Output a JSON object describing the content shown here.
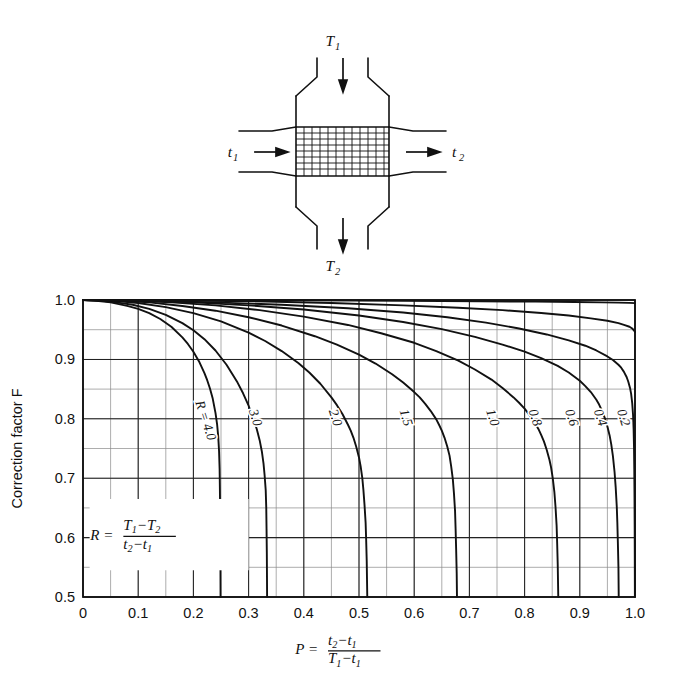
{
  "figure": {
    "diagram": {
      "name": "crossflow-heat-exchanger-schematic",
      "labels": {
        "hot_in": "T1",
        "hot_in_sub": "1",
        "hot_in_main": "T",
        "hot_out_main": "T",
        "hot_out_sub": "2",
        "cold_in_main": "t",
        "cold_in_sub": "1",
        "cold_out_main": "t",
        "cold_out_sub": "2"
      }
    }
  },
  "chart_data": {
    "type": "line",
    "title": "",
    "xlabel_parts": {
      "variable": "P",
      "equals": "=",
      "numerator_a": "t",
      "numerator_a_sub": "2",
      "numerator_minus": "−",
      "numerator_b": "t",
      "numerator_b_sub": "1",
      "denominator_a": "T",
      "denominator_a_sub": "1",
      "denominator_minus": "−",
      "denominator_b": "t",
      "denominator_b_sub": "1"
    },
    "ylabel": "Correction factor F",
    "ylabel_main": "Correction factor",
    "ylabel_italic": "F",
    "annotation_R": {
      "variable": "R",
      "equals": "=",
      "numerator_a": "T",
      "numerator_a_sub": "1",
      "numerator_minus": "−",
      "numerator_b": "T",
      "numerator_b_sub": "2",
      "denominator_a": "t",
      "denominator_a_sub": "2",
      "denominator_minus": "−",
      "denominator_b": "t",
      "denominator_b_sub": "1"
    },
    "xlim": [
      0,
      1.0
    ],
    "ylim": [
      0.5,
      1.0
    ],
    "xticks": [
      0,
      0.1,
      0.2,
      0.3,
      0.4,
      0.5,
      0.6,
      0.7,
      0.8,
      0.9,
      1.0
    ],
    "xticklabels": [
      "0",
      "0.1",
      "0.2",
      "0.3",
      "0.4",
      "0.5",
      "0.6",
      "0.7",
      "0.8",
      "0.9",
      "1.0"
    ],
    "yticks": [
      0.5,
      0.6,
      0.7,
      0.8,
      0.9,
      1.0
    ],
    "yticklabels": [
      "0.5",
      "0.6",
      "0.7",
      "0.8",
      "0.9",
      "1.0"
    ],
    "x_minor_step": 0.05,
    "y_minor_step": 0.05,
    "grid": true,
    "legend": "inline-curve-labels",
    "series": [
      {
        "name": "R = 4.0",
        "label": "R = 4.0",
        "label_prefix": "R =",
        "value": "4.0",
        "points": [
          [
            0,
            1.0
          ],
          [
            0.02,
            0.999
          ],
          [
            0.05,
            0.996
          ],
          [
            0.08,
            0.99
          ],
          [
            0.1,
            0.985
          ],
          [
            0.12,
            0.978
          ],
          [
            0.14,
            0.968
          ],
          [
            0.16,
            0.955
          ],
          [
            0.18,
            0.937
          ],
          [
            0.19,
            0.926
          ],
          [
            0.2,
            0.913
          ],
          [
            0.21,
            0.897
          ],
          [
            0.22,
            0.877
          ],
          [
            0.225,
            0.865
          ],
          [
            0.23,
            0.851
          ],
          [
            0.235,
            0.834
          ],
          [
            0.24,
            0.81
          ],
          [
            0.243,
            0.79
          ],
          [
            0.245,
            0.77
          ],
          [
            0.2465,
            0.745
          ],
          [
            0.2475,
            0.715
          ],
          [
            0.248,
            0.68
          ],
          [
            0.2485,
            0.64
          ],
          [
            0.2488,
            0.6
          ],
          [
            0.249,
            0.555
          ],
          [
            0.2492,
            0.5
          ]
        ]
      },
      {
        "name": "R = 3.0",
        "label": "3.0",
        "value": "3.0",
        "points": [
          [
            0,
            1.0
          ],
          [
            0.03,
            0.999
          ],
          [
            0.06,
            0.996
          ],
          [
            0.09,
            0.992
          ],
          [
            0.12,
            0.985
          ],
          [
            0.15,
            0.975
          ],
          [
            0.18,
            0.961
          ],
          [
            0.2,
            0.949
          ],
          [
            0.22,
            0.934
          ],
          [
            0.24,
            0.915
          ],
          [
            0.26,
            0.891
          ],
          [
            0.28,
            0.861
          ],
          [
            0.29,
            0.843
          ],
          [
            0.3,
            0.822
          ],
          [
            0.31,
            0.797
          ],
          [
            0.315,
            0.782
          ],
          [
            0.32,
            0.764
          ],
          [
            0.324,
            0.745
          ],
          [
            0.327,
            0.725
          ],
          [
            0.329,
            0.705
          ],
          [
            0.331,
            0.68
          ],
          [
            0.332,
            0.65
          ],
          [
            0.3325,
            0.615
          ],
          [
            0.333,
            0.575
          ],
          [
            0.3333,
            0.535
          ],
          [
            0.3335,
            0.5
          ]
        ]
      },
      {
        "name": "R = 2.0",
        "label": "2.0",
        "value": "2.0",
        "points": [
          [
            0,
            1.0
          ],
          [
            0.05,
            0.999
          ],
          [
            0.1,
            0.995
          ],
          [
            0.15,
            0.988
          ],
          [
            0.2,
            0.978
          ],
          [
            0.25,
            0.964
          ],
          [
            0.3,
            0.945
          ],
          [
            0.33,
            0.931
          ],
          [
            0.36,
            0.914
          ],
          [
            0.39,
            0.894
          ],
          [
            0.41,
            0.878
          ],
          [
            0.43,
            0.859
          ],
          [
            0.45,
            0.836
          ],
          [
            0.46,
            0.823
          ],
          [
            0.47,
            0.808
          ],
          [
            0.48,
            0.79
          ],
          [
            0.485,
            0.78
          ],
          [
            0.49,
            0.768
          ],
          [
            0.495,
            0.753
          ],
          [
            0.5,
            0.735
          ],
          [
            0.503,
            0.72
          ],
          [
            0.506,
            0.7
          ],
          [
            0.508,
            0.68
          ],
          [
            0.51,
            0.655
          ],
          [
            0.512,
            0.625
          ],
          [
            0.513,
            0.595
          ],
          [
            0.514,
            0.56
          ],
          [
            0.5145,
            0.53
          ],
          [
            0.515,
            0.5
          ]
        ]
      },
      {
        "name": "R = 1.5",
        "label": "1.5",
        "value": "1.5",
        "points": [
          [
            0,
            1.0
          ],
          [
            0.06,
            0.999
          ],
          [
            0.12,
            0.996
          ],
          [
            0.18,
            0.99
          ],
          [
            0.24,
            0.982
          ],
          [
            0.3,
            0.971
          ],
          [
            0.36,
            0.957
          ],
          [
            0.42,
            0.939
          ],
          [
            0.46,
            0.925
          ],
          [
            0.5,
            0.908
          ],
          [
            0.53,
            0.893
          ],
          [
            0.56,
            0.875
          ],
          [
            0.58,
            0.861
          ],
          [
            0.6,
            0.845
          ],
          [
            0.61,
            0.836
          ],
          [
            0.62,
            0.825
          ],
          [
            0.63,
            0.813
          ],
          [
            0.64,
            0.799
          ],
          [
            0.645,
            0.79
          ],
          [
            0.65,
            0.78
          ],
          [
            0.655,
            0.768
          ],
          [
            0.66,
            0.753
          ],
          [
            0.664,
            0.738
          ],
          [
            0.667,
            0.72
          ],
          [
            0.67,
            0.698
          ],
          [
            0.672,
            0.675
          ],
          [
            0.674,
            0.645
          ],
          [
            0.675,
            0.615
          ],
          [
            0.676,
            0.58
          ],
          [
            0.677,
            0.54
          ],
          [
            0.6775,
            0.5
          ]
        ]
      },
      {
        "name": "R = 1.0",
        "label": "1.0",
        "value": "1.0",
        "points": [
          [
            0,
            1.0
          ],
          [
            0.08,
            0.999
          ],
          [
            0.16,
            0.996
          ],
          [
            0.24,
            0.991
          ],
          [
            0.32,
            0.983
          ],
          [
            0.4,
            0.972
          ],
          [
            0.48,
            0.958
          ],
          [
            0.54,
            0.944
          ],
          [
            0.6,
            0.928
          ],
          [
            0.64,
            0.914
          ],
          [
            0.68,
            0.898
          ],
          [
            0.71,
            0.883
          ],
          [
            0.74,
            0.866
          ],
          [
            0.76,
            0.852
          ],
          [
            0.78,
            0.836
          ],
          [
            0.79,
            0.827
          ],
          [
            0.8,
            0.817
          ],
          [
            0.81,
            0.805
          ],
          [
            0.82,
            0.791
          ],
          [
            0.825,
            0.783
          ],
          [
            0.83,
            0.773
          ],
          [
            0.835,
            0.762
          ],
          [
            0.84,
            0.748
          ],
          [
            0.845,
            0.731
          ],
          [
            0.848,
            0.718
          ],
          [
            0.851,
            0.7
          ],
          [
            0.854,
            0.676
          ],
          [
            0.856,
            0.652
          ],
          [
            0.858,
            0.62
          ],
          [
            0.859,
            0.59
          ],
          [
            0.86,
            0.555
          ],
          [
            0.861,
            0.5
          ]
        ]
      },
      {
        "name": "R = 0.8",
        "label": "0.8",
        "value": "0.8",
        "points": [
          [
            0,
            1.0
          ],
          [
            0.1,
            0.999
          ],
          [
            0.2,
            0.996
          ],
          [
            0.3,
            0.991
          ],
          [
            0.4,
            0.984
          ],
          [
            0.5,
            0.974
          ],
          [
            0.58,
            0.963
          ],
          [
            0.65,
            0.951
          ],
          [
            0.71,
            0.938
          ],
          [
            0.76,
            0.925
          ],
          [
            0.8,
            0.913
          ],
          [
            0.83,
            0.902
          ],
          [
            0.86,
            0.889
          ],
          [
            0.88,
            0.878
          ],
          [
            0.9,
            0.864
          ],
          [
            0.91,
            0.855
          ],
          [
            0.92,
            0.845
          ],
          [
            0.93,
            0.832
          ],
          [
            0.935,
            0.824
          ],
          [
            0.94,
            0.814
          ],
          [
            0.945,
            0.802
          ],
          [
            0.95,
            0.787
          ],
          [
            0.954,
            0.772
          ],
          [
            0.957,
            0.757
          ],
          [
            0.96,
            0.737
          ],
          [
            0.963,
            0.71
          ],
          [
            0.965,
            0.685
          ],
          [
            0.967,
            0.652
          ],
          [
            0.968,
            0.625
          ],
          [
            0.969,
            0.59
          ],
          [
            0.97,
            0.55
          ],
          [
            0.9705,
            0.5
          ]
        ]
      },
      {
        "name": "R = 0.6",
        "label": "0.6",
        "value": "0.6",
        "points": [
          [
            0,
            1.0
          ],
          [
            0.12,
            0.999
          ],
          [
            0.24,
            0.996
          ],
          [
            0.36,
            0.992
          ],
          [
            0.48,
            0.986
          ],
          [
            0.58,
            0.979
          ],
          [
            0.66,
            0.971
          ],
          [
            0.73,
            0.962
          ],
          [
            0.79,
            0.952
          ],
          [
            0.84,
            0.942
          ],
          [
            0.88,
            0.932
          ],
          [
            0.91,
            0.923
          ],
          [
            0.93,
            0.915
          ],
          [
            0.95,
            0.905
          ],
          [
            0.96,
            0.899
          ],
          [
            0.97,
            0.891
          ],
          [
            0.975,
            0.886
          ],
          [
            0.98,
            0.879
          ],
          [
            0.985,
            0.87
          ],
          [
            0.988,
            0.862
          ],
          [
            0.991,
            0.852
          ],
          [
            0.993,
            0.842
          ],
          [
            0.995,
            0.826
          ],
          [
            0.9965,
            0.806
          ],
          [
            0.9975,
            0.782
          ],
          [
            0.9982,
            0.752
          ],
          [
            0.9987,
            0.715
          ],
          [
            0.9991,
            0.67
          ],
          [
            0.9994,
            0.62
          ],
          [
            0.9996,
            0.565
          ],
          [
            0.9998,
            0.5
          ]
        ]
      },
      {
        "name": "R = 0.4",
        "label": "0.4",
        "value": "0.4",
        "points": [
          [
            0,
            1.0
          ],
          [
            0.15,
            0.9995
          ],
          [
            0.3,
            0.998
          ],
          [
            0.45,
            0.995
          ],
          [
            0.58,
            0.991
          ],
          [
            0.68,
            0.987
          ],
          [
            0.76,
            0.983
          ],
          [
            0.83,
            0.978
          ],
          [
            0.88,
            0.974
          ],
          [
            0.92,
            0.969
          ],
          [
            0.95,
            0.965
          ],
          [
            0.97,
            0.961
          ],
          [
            0.98,
            0.958
          ],
          [
            0.99,
            0.955
          ],
          [
            0.995,
            0.952
          ],
          [
            0.998,
            0.949
          ],
          [
            1.0,
            0.946
          ]
        ]
      },
      {
        "name": "R = 0.2",
        "label": "0.2",
        "value": "0.2",
        "points": [
          [
            0,
            1.0
          ],
          [
            0.2,
            0.9998
          ],
          [
            0.4,
            0.9993
          ],
          [
            0.58,
            0.9986
          ],
          [
            0.72,
            0.9979
          ],
          [
            0.82,
            0.9972
          ],
          [
            0.89,
            0.9966
          ],
          [
            0.94,
            0.996
          ],
          [
            0.97,
            0.9955
          ],
          [
            0.99,
            0.9951
          ],
          [
            1.0,
            0.9948
          ]
        ]
      }
    ],
    "curve_labels": [
      {
        "text": "R = 4.0",
        "x": 0.215,
        "y": 0.795
      },
      {
        "text": "3.0",
        "x": 0.305,
        "y": 0.8
      },
      {
        "text": "2.0",
        "x": 0.45,
        "y": 0.8
      },
      {
        "text": "1.5",
        "x": 0.578,
        "y": 0.8
      },
      {
        "text": "1.0",
        "x": 0.735,
        "y": 0.8
      },
      {
        "text": "0.8",
        "x": 0.812,
        "y": 0.8
      },
      {
        "text": "0.6",
        "x": 0.878,
        "y": 0.8
      },
      {
        "text": "0.4",
        "x": 0.93,
        "y": 0.8
      },
      {
        "text": "0.2",
        "x": 0.972,
        "y": 0.8
      }
    ]
  }
}
